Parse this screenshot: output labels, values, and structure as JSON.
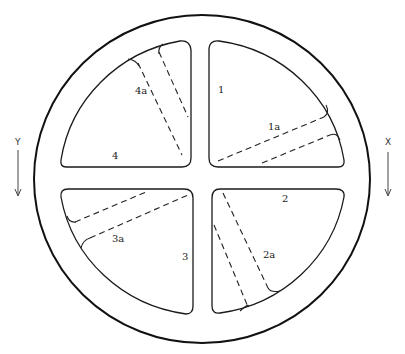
{
  "figure": {
    "colors": {
      "stroke": "#1a1a1a",
      "background": "#ffffff"
    }
  },
  "quadrants": [
    {
      "id": "1",
      "label": "1",
      "band_label": "1a"
    },
    {
      "id": "2",
      "label": "2",
      "band_label": "2a"
    },
    {
      "id": "3",
      "label": "3",
      "band_label": "3a"
    },
    {
      "id": "4",
      "label": "4",
      "band_label": "4a"
    }
  ],
  "axes": {
    "left": {
      "label": "Y",
      "direction": "down"
    },
    "right": {
      "label": "X",
      "direction": "down"
    }
  }
}
